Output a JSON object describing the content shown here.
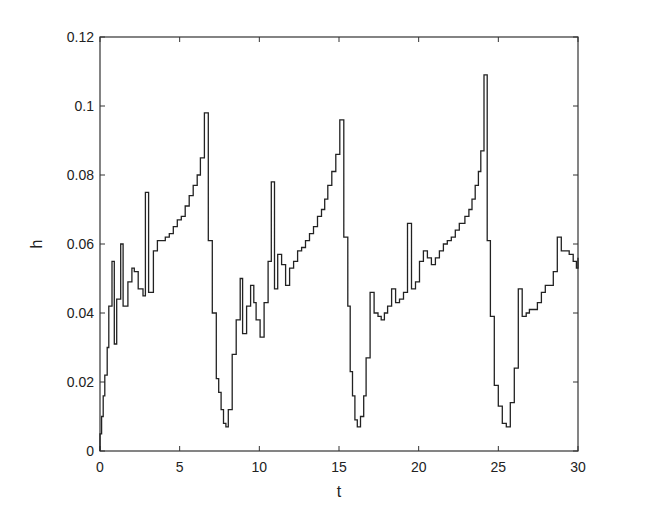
{
  "chart_data": {
    "type": "line",
    "title": "",
    "xlabel": "t",
    "ylabel": "h",
    "xlim": [
      0,
      30
    ],
    "ylim": [
      0,
      0.12
    ],
    "xticks": [
      0,
      5,
      10,
      15,
      20,
      25,
      30
    ],
    "xtick_labels": [
      "0",
      "5",
      "10",
      "15",
      "20",
      "25",
      "30"
    ],
    "yticks": [
      0,
      0.02,
      0.04,
      0.06,
      0.08,
      0.1,
      0.12
    ],
    "ytick_labels": [
      "0",
      "0.02",
      "0.04",
      "0.06",
      "0.08",
      "0.1",
      "0.12"
    ],
    "grid": false,
    "legend": null,
    "line_style": "step",
    "line_color": "#222222",
    "series": [
      {
        "name": "h",
        "t": [
          0.0,
          0.1,
          0.2,
          0.3,
          0.45,
          0.55,
          0.75,
          0.9,
          1.05,
          1.3,
          1.45,
          1.75,
          2.0,
          2.15,
          2.4,
          2.7,
          2.85,
          3.0,
          3.05,
          3.35,
          3.6,
          3.85,
          4.1,
          4.35,
          4.6,
          4.85,
          5.1,
          5.35,
          5.6,
          5.85,
          6.1,
          6.3,
          6.55,
          6.8,
          7.05,
          7.3,
          7.45,
          7.6,
          7.75,
          7.9,
          8.05,
          8.3,
          8.55,
          8.8,
          8.95,
          9.2,
          9.45,
          9.65,
          9.8,
          10.05,
          10.3,
          10.55,
          10.75,
          10.95,
          11.15,
          11.4,
          11.65,
          11.9,
          12.15,
          12.4,
          12.65,
          12.9,
          13.15,
          13.4,
          13.65,
          13.9,
          14.1,
          14.3,
          14.55,
          14.8,
          15.05,
          15.3,
          15.55,
          15.7,
          15.85,
          16.0,
          16.15,
          16.35,
          16.55,
          16.7,
          16.95,
          17.2,
          17.45,
          17.65,
          17.85,
          18.05,
          18.3,
          18.55,
          18.8,
          19.05,
          19.3,
          19.55,
          19.8,
          20.05,
          20.3,
          20.55,
          20.8,
          21.05,
          21.3,
          21.55,
          21.8,
          22.05,
          22.3,
          22.55,
          22.9,
          23.15,
          23.35,
          23.55,
          23.75,
          23.9,
          24.1,
          24.3,
          24.5,
          24.75,
          25.0,
          25.25,
          25.5,
          25.75,
          26.0,
          26.25,
          26.5,
          26.75,
          26.95,
          27.2,
          27.45,
          27.7,
          27.95,
          28.2,
          28.45,
          28.7,
          28.95,
          29.2,
          29.45,
          29.7,
          29.9,
          30.0
        ],
        "h": [
          0.005,
          0.01,
          0.016,
          0.022,
          0.03,
          0.042,
          0.055,
          0.031,
          0.044,
          0.06,
          0.042,
          0.049,
          0.053,
          0.052,
          0.047,
          0.045,
          0.075,
          0.075,
          0.046,
          0.058,
          0.061,
          0.061,
          0.062,
          0.063,
          0.065,
          0.067,
          0.068,
          0.071,
          0.074,
          0.077,
          0.08,
          0.085,
          0.098,
          0.061,
          0.04,
          0.021,
          0.017,
          0.012,
          0.008,
          0.007,
          0.012,
          0.028,
          0.038,
          0.05,
          0.034,
          0.042,
          0.048,
          0.043,
          0.038,
          0.033,
          0.043,
          0.055,
          0.078,
          0.047,
          0.057,
          0.054,
          0.048,
          0.053,
          0.055,
          0.058,
          0.059,
          0.061,
          0.063,
          0.065,
          0.068,
          0.07,
          0.073,
          0.077,
          0.081,
          0.086,
          0.096,
          0.062,
          0.042,
          0.023,
          0.016,
          0.009,
          0.007,
          0.01,
          0.016,
          0.027,
          0.046,
          0.04,
          0.039,
          0.038,
          0.04,
          0.042,
          0.047,
          0.043,
          0.044,
          0.046,
          0.066,
          0.047,
          0.049,
          0.055,
          0.058,
          0.056,
          0.054,
          0.056,
          0.058,
          0.06,
          0.061,
          0.062,
          0.064,
          0.066,
          0.068,
          0.07,
          0.073,
          0.077,
          0.081,
          0.087,
          0.109,
          0.061,
          0.039,
          0.019,
          0.013,
          0.008,
          0.007,
          0.014,
          0.024,
          0.047,
          0.039,
          0.04,
          0.041,
          0.041,
          0.043,
          0.046,
          0.048,
          0.048,
          0.052,
          0.062,
          0.058,
          0.058,
          0.057,
          0.055,
          0.053,
          0.056,
          0.061,
          0.063,
          0.065,
          0.067,
          0.069,
          0.073,
          0.046
        ]
      }
    ]
  }
}
